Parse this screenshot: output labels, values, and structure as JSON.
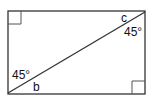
{
  "diagram": {
    "shape": "rectangle",
    "stroke_color": "#333333",
    "background": "#ffffff",
    "rectangle": {
      "x": 8,
      "y": 11,
      "width": 137,
      "height": 83
    },
    "diagonal": {
      "x1": 8,
      "y1": 93,
      "x2": 145,
      "y2": 12
    },
    "right_angle_markers": [
      {
        "corner": "top-left",
        "x": 8,
        "y": 11,
        "size": 13
      },
      {
        "corner": "bottom-right",
        "x": 132,
        "y": 81,
        "size": 13
      }
    ],
    "labels": {
      "top_right_angle_name": "c",
      "top_right_angle_value": "45°",
      "bottom_left_angle_value": "45°",
      "bottom_left_angle_name": "b"
    }
  }
}
